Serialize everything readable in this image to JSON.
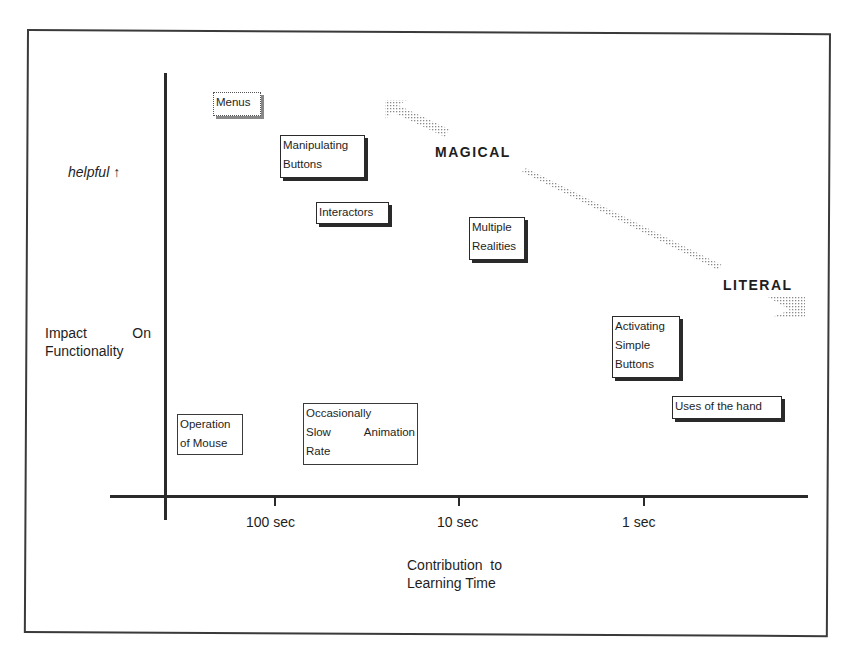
{
  "diagram": {
    "y_axis": {
      "label_line1_a": "Impact",
      "label_line1_b": "On",
      "label_line2": "Functionality",
      "top_hint": "helpful ↑"
    },
    "x_axis": {
      "label_line1": "Contribution  to",
      "label_line2": "Learning Time",
      "ticks": [
        "100 sec",
        "10 sec",
        "1 sec"
      ]
    },
    "arrow_labels": {
      "magical": "MAGICAL",
      "literal": "LITERAL"
    },
    "boxes": [
      {
        "id": "menus",
        "lines": [
          "Menus"
        ],
        "style": "dotted"
      },
      {
        "id": "manipulating-buttons",
        "lines": [
          "Manipulating",
          "Buttons"
        ],
        "style": "shadow"
      },
      {
        "id": "interactors",
        "lines": [
          "Interactors"
        ],
        "style": "shadow"
      },
      {
        "id": "multiple-realities",
        "lines": [
          "Multiple",
          "Realities"
        ],
        "style": "shadow"
      },
      {
        "id": "activating-simple-buttons",
        "lines": [
          "Activating",
          "Simple",
          "Buttons"
        ],
        "style": "shadow"
      },
      {
        "id": "uses-of-the-hand",
        "lines": [
          "Uses of the hand"
        ],
        "style": "shadow"
      },
      {
        "id": "operation-of-mouse",
        "lines": [
          "Operation",
          "of Mouse"
        ],
        "style": "thin"
      },
      {
        "id": "occasionally-slow-animation-rate",
        "lines": [
          "Occasionally",
          "Slow    Animation",
          "Rate"
        ],
        "style": "thin"
      }
    ],
    "colors": {
      "ink": "#1e1e1e",
      "frame": "#3a3a3a",
      "stipple": "#9a9a9a"
    }
  }
}
